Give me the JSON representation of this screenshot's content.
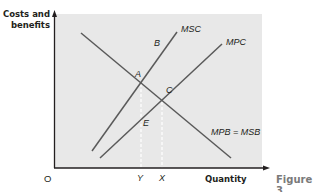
{
  "figure": {
    "caption": "Figure 3",
    "y_axis_label": "Costs and benefits",
    "x_axis_label": "Quantity",
    "origin_label": "O",
    "curves": [
      {
        "name": "MSC",
        "label": "MSC",
        "color": "#5a5a5a"
      },
      {
        "name": "MPC",
        "label": "MPC",
        "color": "#5a5a5a"
      },
      {
        "name": "MPB = MSB",
        "label": "MPB = MSB",
        "color": "#5a5a5a"
      }
    ],
    "points": {
      "A": "A",
      "B": "B",
      "C": "C",
      "E": "E"
    },
    "x_ticks": {
      "Y": "Y",
      "X": "X"
    },
    "colors": {
      "plot_background": "#e8e8e8",
      "axis": "#231f20",
      "curve": "#5a5a5a",
      "dashed_guide": "#ffffff",
      "caption": "#7a7a7a"
    }
  }
}
